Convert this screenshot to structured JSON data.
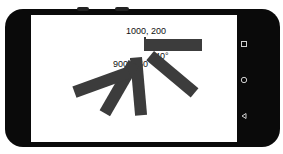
{
  "device": {
    "type": "android-phone-landscape",
    "nav_buttons": [
      {
        "name": "recents",
        "icon": "square-icon"
      },
      {
        "name": "home",
        "icon": "circle-icon"
      },
      {
        "name": "back",
        "icon": "triangle-back-icon"
      }
    ]
  },
  "canvas": {
    "bar_color": "#3c3c3c",
    "labels": {
      "origin_point": "1000, 200",
      "pivot_point": "900, 360",
      "angle": "40°"
    },
    "bars": [
      {
        "id": "bar-0",
        "rotation": 0
      },
      {
        "id": "bar-1",
        "rotation": 40
      },
      {
        "id": "bar-2",
        "rotation": 80
      },
      {
        "id": "bar-3",
        "rotation": 120
      },
      {
        "id": "bar-4",
        "rotation": 160
      }
    ]
  }
}
